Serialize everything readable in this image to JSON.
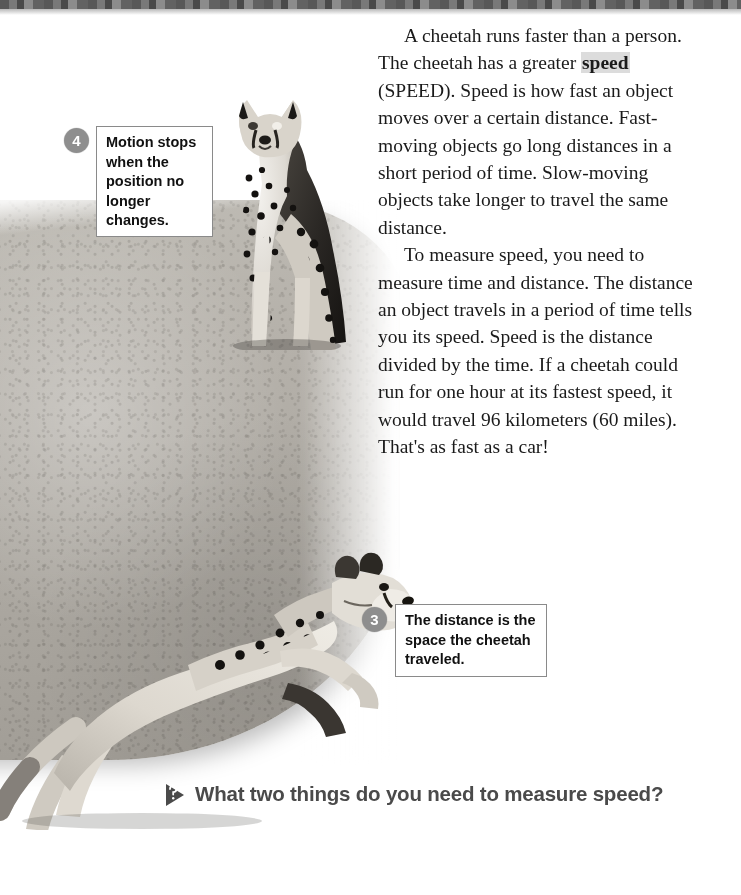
{
  "page": {
    "background_color": "#ffffff"
  },
  "body_text": {
    "paragraph_1_part_1": "A cheetah runs faster than a person. The cheetah has a greater ",
    "highlighted_term": "speed",
    "paragraph_1_part_2": " (SPEED). Speed is how fast an object moves over a certain distance. Fast-moving objects go long distances in a short period of time. Slow-moving objects take longer to travel the same distance.",
    "paragraph_2": "To measure speed, you need to measure time and distance. The distance an object travels in a period of time tells you its speed. Speed is the distance divided by the time. If a cheetah could run for one hour at its fastest speed, it would travel 96 kilometers (60 miles). That's as fast as a car!"
  },
  "callouts": [
    {
      "number": "4",
      "text": "Motion stops when the position no longer changes."
    },
    {
      "number": "3",
      "text": "The distance is the space the cheetah traveled."
    }
  ],
  "question": {
    "icon": "triangle-arrow-icon",
    "text": "What two things do you need to measure speed?"
  },
  "images": {
    "sitting_cheetah": "sitting-cheetah-photo",
    "running_cheetah": "running-cheetah-photo",
    "ground": "savanna-ground-photo",
    "top_strip": "photo-edge-strip"
  },
  "colors": {
    "text": "#1a1a1a",
    "highlight": "#dcdcdc",
    "callout_circle": "#8e8e8e",
    "callout_border": "#8a8a8a",
    "question_text": "#4a4a4a",
    "ground": "#b6b2ab"
  }
}
